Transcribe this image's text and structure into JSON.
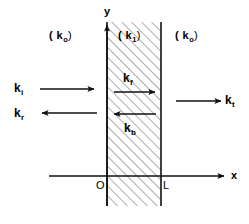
{
  "figure": {
    "colors": {
      "stroke": "#111111",
      "hatch": "#555555",
      "background": "#ffffff"
    },
    "geometry": {
      "slab_left_x": 107,
      "slab_right_x": 161,
      "slab_top_y": 22,
      "slab_bottom_y": 206,
      "axis_y": 176
    },
    "axes": {
      "x_label": "x",
      "y_label": "y"
    },
    "ticks": [
      {
        "label": "O",
        "position": "slab-left"
      },
      {
        "label": "L",
        "position": "slab-right"
      }
    ],
    "regions": [
      {
        "name": "left-medium",
        "label": "( k",
        "sub": "o",
        "close": ")"
      },
      {
        "name": "slab-medium",
        "label": "( k",
        "sub": "1",
        "close": ")"
      },
      {
        "name": "right-medium",
        "label": "( k",
        "sub": "o",
        "close": ")"
      }
    ],
    "vectors": [
      {
        "name": "incident",
        "label": "k",
        "sub": "i",
        "direction": "right"
      },
      {
        "name": "reflected",
        "label": "k",
        "sub": "r",
        "direction": "left"
      },
      {
        "name": "forward",
        "label": "k",
        "sub": "f",
        "direction": "right"
      },
      {
        "name": "backward",
        "label": "k",
        "sub": "b",
        "direction": "left"
      },
      {
        "name": "transmitted",
        "label": "k",
        "sub": "t",
        "direction": "right"
      }
    ]
  }
}
